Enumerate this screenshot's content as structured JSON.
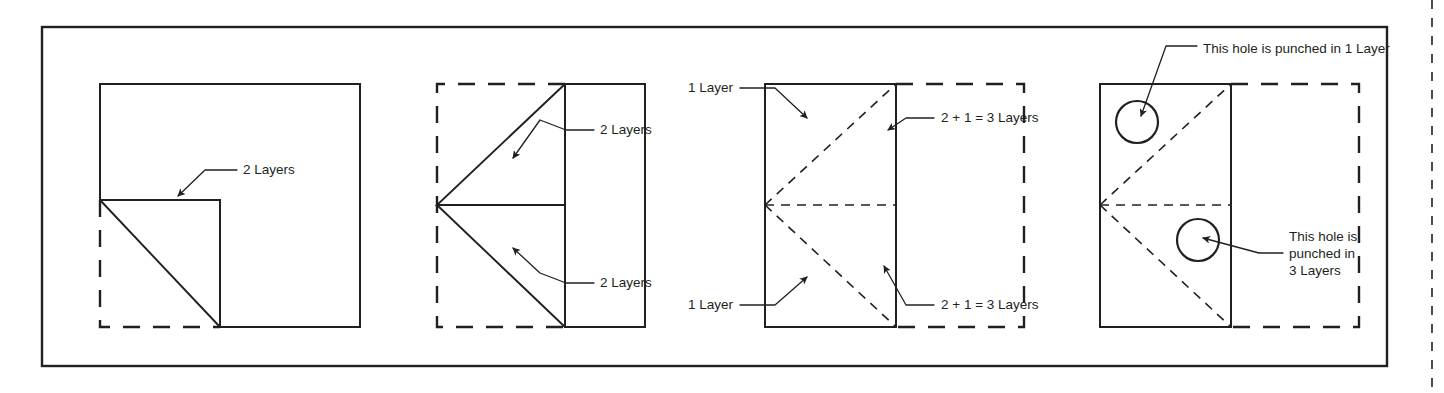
{
  "figure": {
    "background_color": "#ffffff",
    "ink_color": "#231f20",
    "frame": {
      "x": 42,
      "y": 27,
      "width": 1345,
      "height": 339
    },
    "crop_mark": {
      "x": 1432,
      "label": "page-edge-dashed-rule"
    }
  },
  "panels": [
    {
      "id": "panel-1",
      "name": "first-fold-corner",
      "description": "Square sheet with lower-left corner folded up to form a triangle flap",
      "labels": [
        {
          "id": "p1-label-1",
          "text": "2 Layers",
          "x": 243,
          "y": 170
        }
      ],
      "shapes": {
        "sheet": {
          "x": 100,
          "y": 84,
          "width": 260,
          "height": 243
        },
        "flap_square": {
          "x": 100,
          "y": 200,
          "width": 120,
          "height": 127
        },
        "ghost_outline": "lower-left quadrant dashed"
      }
    },
    {
      "id": "panel-2",
      "name": "second-fold-triangles",
      "description": "Half sheet folded left forming two mirrored triangles meeting at a left vertex",
      "labels": [
        {
          "id": "p2-label-1",
          "text": "2 Layers",
          "x": 600,
          "y": 130
        },
        {
          "id": "p2-label-2",
          "text": "2 Layers",
          "x": 600,
          "y": 283
        }
      ],
      "shapes": {
        "sheet": {
          "x": 565,
          "y": 84,
          "width": 80,
          "height": 243
        },
        "ghost_outline": {
          "x": 437,
          "y": 84,
          "width": 128,
          "height": 243
        },
        "apex": {
          "x": 437,
          "y": 205
        }
      }
    },
    {
      "id": "panel-3",
      "name": "folded-stack-layer-count",
      "description": "Folded rectangle with dashed creases showing layer counts on each region",
      "labels": [
        {
          "id": "p3-label-1",
          "text": "1 Layer",
          "x": 733,
          "y": 88,
          "anchor": "end"
        },
        {
          "id": "p3-label-2",
          "text": "1 Layer",
          "x": 733,
          "y": 305,
          "anchor": "end"
        },
        {
          "id": "p3-label-3",
          "text": "2 + 1 = 3 Layers",
          "x": 941,
          "y": 118,
          "anchor": "start"
        },
        {
          "id": "p3-label-4",
          "text": "2 + 1 = 3 Layers",
          "x": 941,
          "y": 305,
          "anchor": "start"
        }
      ],
      "shapes": {
        "sheet": {
          "x": 765,
          "y": 84,
          "width": 131,
          "height": 243
        },
        "ghost_outline": {
          "x": 896,
          "y": 84,
          "width": 128,
          "height": 243
        }
      }
    },
    {
      "id": "panel-4",
      "name": "punched-holes",
      "description": "Folded stack with two punched holes, one in a single layer and one through three layers",
      "labels": [
        {
          "id": "p4-label-1",
          "text": "This hole is punched in 1 Layer",
          "x": 1203,
          "y": 49,
          "anchor": "start"
        },
        {
          "id": "p4-label-2",
          "lines": [
            "This hole is",
            "punched in",
            "3 Layers"
          ],
          "x": 1289,
          "y": 237,
          "anchor": "start"
        }
      ],
      "shapes": {
        "sheet": {
          "x": 1100,
          "y": 84,
          "width": 131,
          "height": 243
        },
        "ghost_outline": {
          "x": 1231,
          "y": 84,
          "width": 128,
          "height": 243
        },
        "holes": [
          {
            "id": "hole-1-layer",
            "cx": 1137,
            "cy": 122,
            "r": 21,
            "layers": 1
          },
          {
            "id": "hole-3-layer",
            "cx": 1198,
            "cy": 240,
            "r": 21,
            "layers": 3
          }
        ]
      }
    }
  ],
  "legend": {
    "solid_line_meaning": "actual paper edge",
    "dashed_heavy_meaning": "original unfolded sheet outline",
    "dashed_light_meaning": "fold crease"
  }
}
